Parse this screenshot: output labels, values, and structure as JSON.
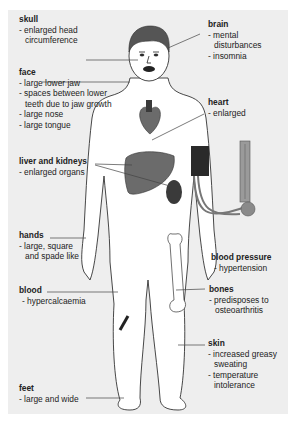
{
  "diagram": {
    "colors": {
      "panel": "#eeeeee",
      "skin": "#ffffff",
      "outline": "#333333",
      "hair": "#555555",
      "organ_dark": "#3a3a3a",
      "organ_mid": "#6b6b6b",
      "organ_light": "#a8a8a8",
      "leader_line": "#444444"
    },
    "labels": {
      "skull": {
        "title": "skull",
        "items": [
          "- enlarged head",
          "circumference"
        ]
      },
      "face": {
        "title": "face",
        "items": [
          "- large lower jaw",
          "- spaces between lower",
          "teeth due to jaw growth",
          "- large nose",
          "- large tongue"
        ]
      },
      "liver_kidneys": {
        "title": "liver and kidneys",
        "items": [
          "- enlarged organs"
        ]
      },
      "hands": {
        "title": "hands",
        "items": [
          "- large, square",
          "and spade like"
        ]
      },
      "blood": {
        "title": "blood",
        "items": [
          "- hypercalcaemia"
        ]
      },
      "feet": {
        "title": "feet",
        "items": [
          "- large and wide"
        ]
      },
      "brain": {
        "title": "brain",
        "items": [
          "- mental",
          "disturbances",
          "- insomnia"
        ]
      },
      "heart": {
        "title": "heart",
        "items": [
          "- enlarged"
        ]
      },
      "blood_pressure": {
        "title": "blood pressure",
        "items": [
          "- hypertension"
        ]
      },
      "bones": {
        "title": "bones",
        "items": [
          "- predisposes to",
          "osteoarthritis"
        ]
      },
      "skin": {
        "title": "skin",
        "items": [
          "- increased greasy",
          "sweating",
          "- temperature",
          "intolerance"
        ]
      }
    }
  }
}
